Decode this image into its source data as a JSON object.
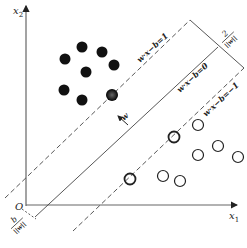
{
  "diagram": {
    "axes": {
      "x_label": "x",
      "x_sub": "1",
      "y_label": "x",
      "y_sub": "2",
      "origin_label": "O"
    },
    "hyperplanes": {
      "upper": "w·x−b=1",
      "middle": "w·x−b=0",
      "lower": "w·x−b=−1"
    },
    "margin_label": {
      "num": "2",
      "den": "||w||"
    },
    "offset_label": {
      "num": "b",
      "den": "||w||"
    },
    "normal_label": "w",
    "class_positive": [
      [
        82,
        47
      ],
      [
        102,
        52
      ],
      [
        65,
        59
      ],
      [
        114,
        65
      ],
      [
        86,
        72
      ],
      [
        64,
        90
      ],
      [
        82,
        100
      ]
    ],
    "class_positive_support": [
      [
        112,
        95
      ]
    ],
    "class_negative": [
      [
        198,
        125
      ],
      [
        218,
        146
      ],
      [
        198,
        155
      ],
      [
        238,
        157
      ],
      [
        163,
        176
      ],
      [
        180,
        181
      ]
    ],
    "class_negative_support": [
      [
        130,
        179
      ],
      [
        174,
        137
      ]
    ],
    "colors": {
      "ink": "#222222",
      "axis": "#555555",
      "support_fill": "#444444"
    }
  }
}
